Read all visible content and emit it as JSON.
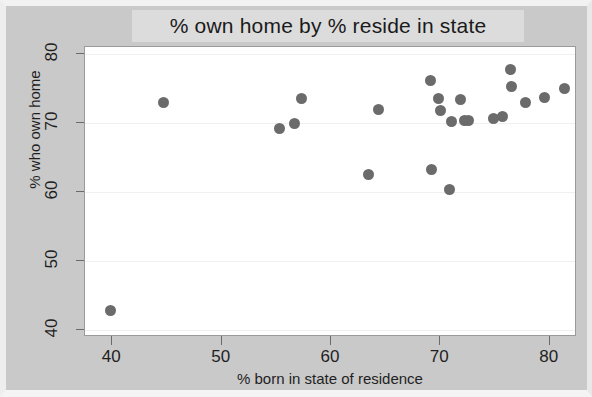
{
  "chart_data": {
    "type": "scatter",
    "title": "% own home by % reside in state",
    "xlabel": "% born in state of residence",
    "ylabel": "% who own home",
    "xlim": [
      37.5,
      82.5
    ],
    "ylim": [
      39.0,
      81.0
    ],
    "xticks": [
      40,
      50,
      60,
      70,
      80
    ],
    "yticks": [
      40,
      50,
      60,
      70,
      80
    ],
    "xtick_labels": [
      "40",
      "50",
      "60",
      "70",
      "80"
    ],
    "ytick_labels": [
      "40",
      "50",
      "60",
      "70",
      "80"
    ],
    "grid": true,
    "legend": null,
    "marker": {
      "shape": "circle",
      "color": "#6b6b6b",
      "size_px": 11
    },
    "points": [
      {
        "x": 39.8,
        "y": 42.8
      },
      {
        "x": 44.7,
        "y": 72.9
      },
      {
        "x": 55.3,
        "y": 69.2
      },
      {
        "x": 56.7,
        "y": 69.9
      },
      {
        "x": 57.3,
        "y": 73.5
      },
      {
        "x": 63.4,
        "y": 62.5
      },
      {
        "x": 64.3,
        "y": 72.0
      },
      {
        "x": 69.1,
        "y": 76.2
      },
      {
        "x": 69.2,
        "y": 63.3
      },
      {
        "x": 69.8,
        "y": 73.6
      },
      {
        "x": 70.0,
        "y": 71.8
      },
      {
        "x": 70.8,
        "y": 60.4
      },
      {
        "x": 71.0,
        "y": 70.2
      },
      {
        "x": 71.8,
        "y": 73.4
      },
      {
        "x": 72.2,
        "y": 70.3
      },
      {
        "x": 72.6,
        "y": 70.4
      },
      {
        "x": 74.9,
        "y": 70.7
      },
      {
        "x": 75.7,
        "y": 70.9
      },
      {
        "x": 76.4,
        "y": 77.8
      },
      {
        "x": 76.5,
        "y": 75.3
      },
      {
        "x": 77.8,
        "y": 72.9
      },
      {
        "x": 79.5,
        "y": 73.7
      },
      {
        "x": 81.4,
        "y": 75.0
      }
    ]
  }
}
